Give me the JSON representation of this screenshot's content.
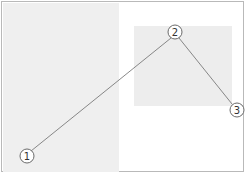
{
  "diagram": {
    "frame": {
      "border_color": "#b9b9b9",
      "background": "#ffffff"
    },
    "regions": [
      {
        "name": "left-panel",
        "color": "#efefef"
      },
      {
        "name": "right-box",
        "color": "#ededed"
      }
    ],
    "line_color": "#7a7a7a",
    "markers": [
      {
        "label": "1",
        "glyph": "①",
        "x": 27,
        "y": 156
      },
      {
        "label": "2",
        "glyph": "②",
        "x": 175,
        "y": 32
      },
      {
        "label": "3",
        "glyph": "③",
        "x": 237,
        "y": 110
      }
    ],
    "connections": [
      {
        "from": "1",
        "to": "2"
      },
      {
        "from": "2",
        "to": "3"
      }
    ]
  }
}
